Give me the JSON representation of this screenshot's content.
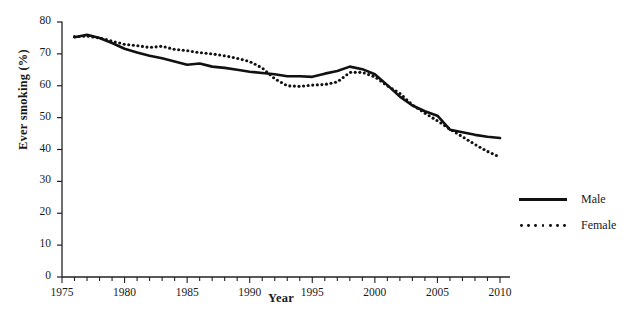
{
  "chart_data": {
    "type": "line",
    "title": "",
    "xlabel": "Year",
    "ylabel": "Ever smoking (%)",
    "xlim": [
      1975,
      2010
    ],
    "ylim": [
      0,
      80
    ],
    "y_ticks": [
      0,
      10,
      20,
      30,
      40,
      50,
      60,
      70,
      80
    ],
    "x_ticks": [
      1975,
      1980,
      1985,
      1990,
      1995,
      2000,
      2005,
      2010
    ],
    "x_minor_tick_step": 1,
    "grid": false,
    "legend_position": "right",
    "x": [
      1976,
      1977,
      1978,
      1979,
      1980,
      1981,
      1982,
      1983,
      1984,
      1985,
      1986,
      1987,
      1988,
      1989,
      1990,
      1991,
      1992,
      1993,
      1994,
      1995,
      1996,
      1997,
      1998,
      1999,
      2000,
      2001,
      2002,
      2003,
      2004,
      2005,
      2006,
      2007,
      2008,
      2009,
      2010
    ],
    "series": [
      {
        "name": "Male",
        "style": "solid",
        "color": "#111111",
        "values": [
          75.2,
          76.0,
          75.0,
          73.4,
          71.6,
          70.4,
          69.4,
          68.6,
          67.6,
          66.6,
          67.0,
          66.0,
          65.6,
          65.0,
          64.4,
          64.0,
          63.6,
          63.0,
          63.0,
          62.8,
          63.8,
          64.6,
          66.0,
          65.2,
          63.6,
          60.2,
          56.6,
          53.8,
          52.0,
          50.6,
          46.2,
          45.4,
          44.6,
          44.0,
          43.6
        ]
      },
      {
        "name": "Female",
        "style": "dotted",
        "color": "#111111",
        "values": [
          75.4,
          75.6,
          75.0,
          74.0,
          73.0,
          72.6,
          72.0,
          72.4,
          71.4,
          71.0,
          70.4,
          70.0,
          69.4,
          68.6,
          67.6,
          65.6,
          62.2,
          60.0,
          59.8,
          60.2,
          60.4,
          61.2,
          64.2,
          64.2,
          62.8,
          60.0,
          57.6,
          54.0,
          51.4,
          49.0,
          46.4,
          44.0,
          41.6,
          39.4,
          37.6
        ]
      }
    ]
  },
  "legend": {
    "items": [
      {
        "label": "Male",
        "style": "solid"
      },
      {
        "label": "Female",
        "style": "dotted"
      }
    ]
  }
}
